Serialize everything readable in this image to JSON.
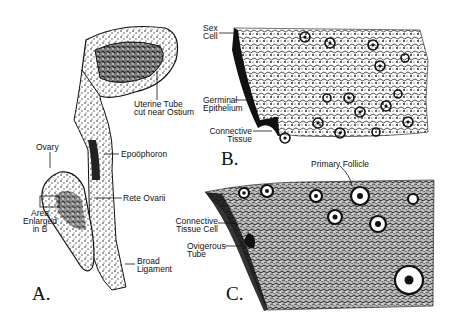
{
  "figure": {
    "panels": {
      "a": {
        "letter": "A."
      },
      "b": {
        "letter": "B."
      },
      "c": {
        "letter": "C."
      }
    },
    "labels_a": {
      "uterine_tube_1": "Uterine Tube",
      "uterine_tube_2": "cut near Ostium",
      "ovary": "Ovary",
      "epoophoron": "Epoöphoron",
      "rete_ovarii": "Rete Ovarii",
      "area_1": "Area",
      "area_2": "Enlarged",
      "area_3": "in B",
      "broad_1": "Broad",
      "broad_2": "Ligament"
    },
    "labels_b": {
      "sex_cell_1": "Sex",
      "sex_cell_2": "Cell",
      "germinal_1": "Germinal",
      "germinal_2": "Epithelium",
      "connective_1": "Connective",
      "connective_2": "Tissue"
    },
    "labels_c": {
      "primary_follicle": "Primary Follicle",
      "ct_cell_1": "Connective",
      "ct_cell_2": "Tissue Cell",
      "ovigerous_1": "Ovigerous",
      "ovigerous_2": "Tube"
    },
    "colors": {
      "ink": "#111111",
      "paper": "#ffffff",
      "stipple": "#3a3a3a"
    }
  }
}
